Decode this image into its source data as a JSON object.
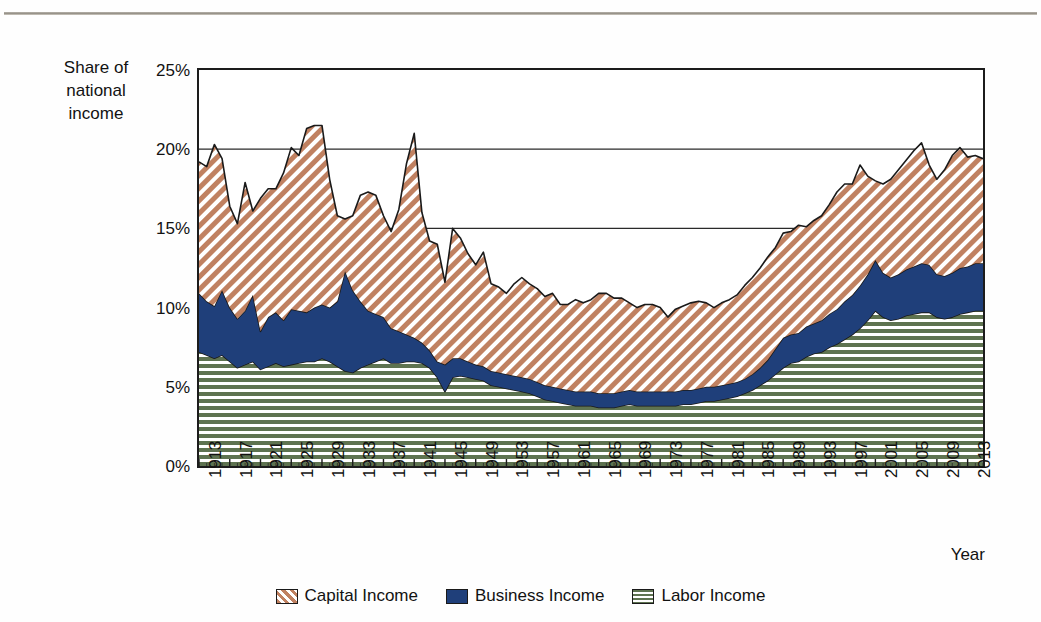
{
  "axes": {
    "y_caption": "Share of\nnational\nincome",
    "y_ticks": [
      "25%",
      "20%",
      "15%",
      "10%",
      "5%",
      "0%"
    ],
    "x_title": "Year",
    "x_ticks": [
      "1913",
      "1917",
      "1921",
      "1925",
      "1929",
      "1933",
      "1937",
      "1941",
      "1945",
      "1949",
      "1953",
      "1957",
      "1961",
      "1965",
      "1969",
      "1973",
      "1977",
      "1981",
      "1985",
      "1989",
      "1993",
      "1997",
      "2001",
      "2005",
      "2009",
      "2013"
    ]
  },
  "legend": {
    "items": [
      {
        "label": "Capital Income",
        "swatch": "diagonal-hatch-swatch",
        "color": "#c08161"
      },
      {
        "label": "Business Income",
        "swatch": "solid-navy-swatch",
        "color": "#1f3f7a"
      },
      {
        "label": "Labor Income",
        "swatch": "horizontal-hatch-swatch",
        "color": "#5e7350"
      }
    ]
  },
  "chart_data": {
    "type": "area",
    "stacked": true,
    "title": "",
    "xlabel": "Year",
    "ylabel": "Share of national income",
    "ylim": [
      0,
      25
    ],
    "xlim": [
      1913,
      2015
    ],
    "ytick_interval": 5,
    "gridlines": [
      "15%",
      "20%",
      "25%"
    ],
    "legend_position": "bottom",
    "units": "percent of national income",
    "x": [
      1913,
      1914,
      1915,
      1916,
      1917,
      1918,
      1919,
      1920,
      1921,
      1922,
      1923,
      1924,
      1925,
      1926,
      1927,
      1928,
      1929,
      1930,
      1931,
      1932,
      1933,
      1934,
      1935,
      1936,
      1937,
      1938,
      1939,
      1940,
      1941,
      1942,
      1943,
      1944,
      1945,
      1946,
      1947,
      1948,
      1949,
      1950,
      1951,
      1952,
      1953,
      1954,
      1955,
      1956,
      1957,
      1958,
      1959,
      1960,
      1961,
      1962,
      1963,
      1964,
      1965,
      1966,
      1967,
      1968,
      1969,
      1970,
      1971,
      1972,
      1973,
      1974,
      1975,
      1976,
      1977,
      1978,
      1979,
      1980,
      1981,
      1982,
      1983,
      1984,
      1985,
      1986,
      1987,
      1988,
      1989,
      1990,
      1991,
      1992,
      1993,
      1994,
      1995,
      1996,
      1997,
      1998,
      1999,
      2000,
      2001,
      2002,
      2003,
      2004,
      2005,
      2006,
      2007,
      2008,
      2009,
      2010,
      2011,
      2012,
      2013,
      2014,
      2015
    ],
    "series": [
      {
        "name": "Labor Income",
        "color": "#5e7350",
        "pattern": "horizontal-lines",
        "values": [
          7.2,
          7.0,
          6.8,
          7.0,
          6.6,
          6.2,
          6.4,
          6.6,
          6.1,
          6.3,
          6.5,
          6.3,
          6.4,
          6.5,
          6.6,
          6.6,
          6.8,
          6.6,
          6.3,
          6.0,
          5.9,
          6.2,
          6.4,
          6.6,
          6.8,
          6.5,
          6.5,
          6.6,
          6.6,
          6.5,
          6.2,
          5.6,
          4.7,
          5.6,
          5.7,
          5.6,
          5.5,
          5.4,
          5.1,
          5.0,
          4.9,
          4.8,
          4.7,
          4.6,
          4.4,
          4.2,
          4.1,
          4.0,
          3.9,
          3.8,
          3.8,
          3.8,
          3.7,
          3.7,
          3.7,
          3.8,
          3.9,
          3.8,
          3.8,
          3.8,
          3.8,
          3.8,
          3.8,
          3.9,
          3.9,
          4.0,
          4.1,
          4.1,
          4.2,
          4.3,
          4.4,
          4.6,
          4.8,
          5.1,
          5.4,
          5.8,
          6.2,
          6.5,
          6.6,
          6.9,
          7.1,
          7.2,
          7.5,
          7.7,
          8.0,
          8.3,
          8.7,
          9.2,
          9.8,
          9.4,
          9.2,
          9.3,
          9.5,
          9.6,
          9.7,
          9.7,
          9.4,
          9.3,
          9.4,
          9.6,
          9.7,
          9.8,
          9.8
        ]
      },
      {
        "name": "Business Income",
        "color": "#1f3f7a",
        "pattern": "solid",
        "values": [
          3.7,
          3.4,
          3.3,
          4.1,
          3.4,
          3.1,
          3.4,
          4.2,
          2.4,
          3.1,
          3.2,
          2.9,
          3.5,
          3.3,
          3.1,
          3.4,
          3.4,
          3.4,
          4.1,
          6.3,
          5.2,
          4.2,
          3.4,
          3.0,
          2.6,
          2.2,
          2.0,
          1.7,
          1.5,
          1.3,
          1.1,
          1.0,
          1.7,
          1.2,
          1.1,
          1.0,
          0.9,
          0.9,
          0.9,
          0.9,
          0.9,
          0.9,
          0.9,
          0.9,
          0.9,
          0.9,
          0.9,
          0.9,
          0.9,
          0.9,
          0.9,
          0.9,
          0.9,
          0.9,
          0.9,
          0.9,
          0.9,
          0.9,
          0.9,
          0.9,
          0.9,
          0.9,
          0.9,
          0.9,
          0.9,
          0.9,
          0.9,
          0.9,
          0.9,
          0.9,
          0.9,
          0.9,
          1.0,
          1.1,
          1.3,
          1.6,
          1.9,
          1.8,
          1.8,
          1.9,
          1.9,
          2.0,
          2.1,
          2.2,
          2.4,
          2.5,
          2.7,
          2.9,
          3.2,
          2.8,
          2.7,
          2.8,
          2.9,
          3.0,
          3.1,
          3.0,
          2.7,
          2.7,
          2.8,
          2.9,
          2.9,
          3.0,
          3.0
        ]
      },
      {
        "name": "Capital Income",
        "color": "#c08161",
        "pattern": "diagonal-hatch",
        "values": [
          8.3,
          8.5,
          10.2,
          8.3,
          6.4,
          6.0,
          8.1,
          5.3,
          8.4,
          8.1,
          7.8,
          9.3,
          10.2,
          9.8,
          11.6,
          11.5,
          11.3,
          8.1,
          5.4,
          3.3,
          4.7,
          6.7,
          7.5,
          7.5,
          6.4,
          6.1,
          7.7,
          10.8,
          12.9,
          8.2,
          6.9,
          7.4,
          5.2,
          8.2,
          7.6,
          6.8,
          6.3,
          7.2,
          5.5,
          5.4,
          5.1,
          5.8,
          6.3,
          6.0,
          5.9,
          5.6,
          5.9,
          5.3,
          5.4,
          5.8,
          5.6,
          5.8,
          6.3,
          6.3,
          6.0,
          5.9,
          5.5,
          5.3,
          5.5,
          5.5,
          5.3,
          4.7,
          5.2,
          5.3,
          5.5,
          5.5,
          5.3,
          5.0,
          5.2,
          5.3,
          5.5,
          5.9,
          6.1,
          6.3,
          6.5,
          6.4,
          6.6,
          6.5,
          6.8,
          6.3,
          6.5,
          6.6,
          6.9,
          7.4,
          7.4,
          7.0,
          7.6,
          6.2,
          5.0,
          5.6,
          6.2,
          6.6,
          6.9,
          7.3,
          7.6,
          6.3,
          6.0,
          6.7,
          7.4,
          7.6,
          6.9,
          6.8,
          6.6
        ]
      }
    ]
  }
}
